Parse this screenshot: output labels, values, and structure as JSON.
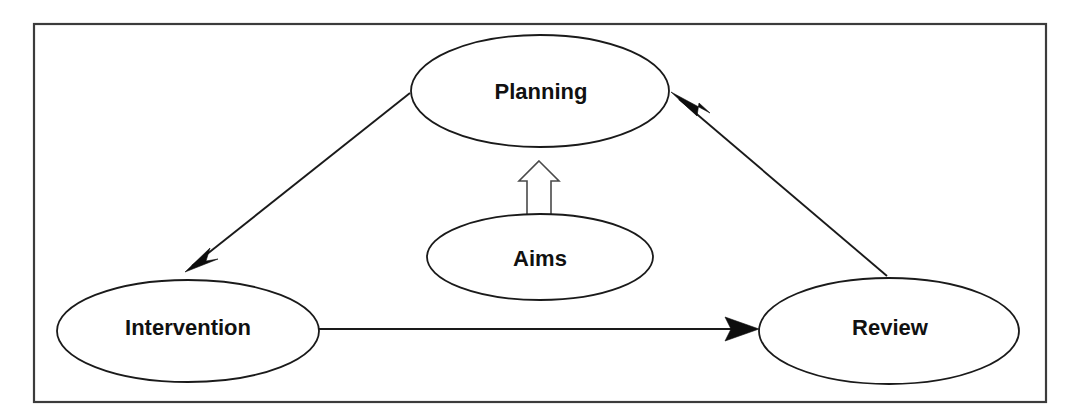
{
  "diagram": {
    "background_color": "#ffffff",
    "frame": {
      "name": "outer-border",
      "x": 34,
      "y": 24,
      "width": 1012,
      "height": 378,
      "stroke_color": "#3c3c3c"
    },
    "nodes": [
      {
        "id": "planning",
        "label": "Planning",
        "cx": 540,
        "cy": 91,
        "rx": 129,
        "ry": 56,
        "font_size": 22,
        "stroke_color": "#1a1a1a",
        "fill_color": "#ffffff"
      },
      {
        "id": "aims",
        "label": "Aims",
        "cx": 540,
        "cy": 257,
        "rx": 113,
        "ry": 43,
        "font_size": 22,
        "stroke_color": "#1a1a1a",
        "fill_color": "#ffffff"
      },
      {
        "id": "intervention",
        "label": "Intervention",
        "cx": 188,
        "cy": 331,
        "rx": 131,
        "ry": 51,
        "font_size": 22,
        "stroke_color": "#1a1a1a",
        "fill_color": "#ffffff"
      },
      {
        "id": "review",
        "label": "Review",
        "cx": 889,
        "cy": 331,
        "rx": 130,
        "ry": 53,
        "font_size": 22,
        "stroke_color": "#1a1a1a",
        "fill_color": "#ffffff"
      }
    ],
    "connectors": [
      {
        "id": "planning-to-intervention",
        "from": "planning",
        "to": "intervention",
        "style": "solid-filled-arrow",
        "x1": 410,
        "y1": 93,
        "x2": 192,
        "y2": 266,
        "tip_x": 185,
        "tip_y": 272
      },
      {
        "id": "intervention-to-review",
        "from": "intervention",
        "to": "review",
        "style": "solid-filled-arrow",
        "x1": 319,
        "y1": 329,
        "x2": 752,
        "y2": 329,
        "tip_x": 759,
        "tip_y": 329
      },
      {
        "id": "review-to-planning",
        "from": "review",
        "to": "planning",
        "style": "solid-filled-arrow",
        "x1": 887,
        "y1": 276,
        "x2": 679,
        "y2": 99,
        "tip_x": 671,
        "tip_y": 92
      },
      {
        "id": "aims-to-planning",
        "from": "aims",
        "to": "planning",
        "style": "hollow-block-arrow",
        "tip_x": 539,
        "tip_y": 161,
        "base_y": 217,
        "head_half_width": 20,
        "shaft_half_width": 12,
        "head_height": 20
      }
    ]
  }
}
